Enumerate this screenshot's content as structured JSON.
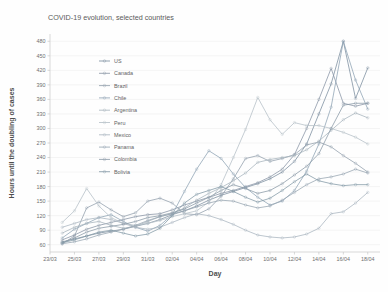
{
  "chart_data": {
    "type": "line",
    "title": "COVID-19 evolution, selected countries",
    "xlabel": "Day",
    "ylabel": "Hours until the doubling of cases",
    "grid": true,
    "legend_position": "upper-left-inside",
    "xlim": [
      0,
      27
    ],
    "ylim": [
      45,
      495
    ],
    "yticks": [
      60,
      90,
      120,
      150,
      180,
      210,
      240,
      270,
      300,
      330,
      360,
      390,
      420,
      450,
      480
    ],
    "xticks": [
      "23/03",
      "25/03",
      "27/03",
      "29/03",
      "31/03",
      "02/04",
      "04/04",
      "06/04",
      "08/04",
      "10/04",
      "12/04",
      "14/04",
      "16/04",
      "18/04"
    ],
    "xtick_positions": [
      0,
      2,
      4,
      6,
      8,
      10,
      12,
      14,
      16,
      18,
      20,
      22,
      24,
      26
    ],
    "x": [
      1,
      2,
      3,
      4,
      5,
      6,
      7,
      8,
      9,
      10,
      11,
      12,
      13,
      14,
      15,
      16,
      17,
      18,
      19,
      20,
      21,
      22,
      23,
      24,
      25,
      26
    ],
    "series": [
      {
        "name": "US",
        "color": "#7d8fa0",
        "values": [
          66,
          72,
          78,
          84,
          88,
          92,
          98,
          104,
          112,
          122,
          130,
          140,
          152,
          162,
          170,
          178,
          186,
          196,
          210,
          232,
          268,
          330,
          392,
          480,
          362,
          425
        ]
      },
      {
        "name": "Canada",
        "color": "#8a96a6",
        "values": [
          70,
          80,
          92,
          100,
          106,
          112,
          118,
          122,
          124,
          132,
          142,
          150,
          158,
          166,
          172,
          180,
          188,
          200,
          216,
          246,
          300,
          360,
          424,
          352,
          346,
          352
        ]
      },
      {
        "name": "Brazil",
        "color": "#93a0ad",
        "values": [
          62,
          78,
          136,
          148,
          132,
          118,
          126,
          150,
          156,
          146,
          124,
          122,
          134,
          160,
          196,
          238,
          244,
          232,
          238,
          246,
          266,
          272,
          262,
          244,
          228,
          210
        ]
      },
      {
        "name": "Chile",
        "color": "#8fa3b4",
        "values": [
          74,
          92,
          104,
          116,
          122,
          108,
          96,
          88,
          100,
          122,
          170,
          216,
          254,
          238,
          206,
          178,
          158,
          142,
          150,
          172,
          212,
          268,
          344,
          480,
          400,
          340
        ]
      },
      {
        "name": "Argentina",
        "color": "#a8b4bd",
        "values": [
          84,
          96,
          104,
          108,
          100,
          94,
          98,
          108,
          118,
          124,
          136,
          152,
          166,
          178,
          192,
          208,
          230,
          236,
          240,
          244,
          256,
          274,
          296,
          318,
          332,
          322
        ]
      },
      {
        "name": "Peru",
        "color": "#b6c0c8",
        "values": [
          106,
          130,
          176,
          140,
          116,
          104,
          100,
          104,
          110,
          118,
          124,
          130,
          148,
          184,
          240,
          298,
          364,
          318,
          288,
          312,
          306,
          306,
          300,
          292,
          282,
          268
        ]
      },
      {
        "name": "Mexico",
        "color": "#aab6c0",
        "values": [
          96,
          104,
          112,
          116,
          112,
          104,
          96,
          92,
          96,
          106,
          116,
          124,
          120,
          112,
          102,
          90,
          80,
          76,
          74,
          76,
          82,
          94,
          124,
          128,
          146,
          168
        ]
      },
      {
        "name": "Panama",
        "color": "#98a6b2",
        "values": [
          62,
          66,
          72,
          80,
          86,
          92,
          100,
          110,
          118,
          124,
          130,
          138,
          146,
          152,
          150,
          142,
          136,
          140,
          152,
          168,
          184,
          196,
          200,
          206,
          216,
          208
        ]
      },
      {
        "name": "Colombia",
        "color": "#8b9aa8",
        "values": [
          64,
          74,
          86,
          94,
          98,
          102,
          108,
          116,
          120,
          126,
          134,
          146,
          158,
          172,
          184,
          176,
          166,
          172,
          186,
          204,
          222,
          248,
          300,
          348,
          352,
          352
        ]
      },
      {
        "name": "Bolivia",
        "color": "#859aa8",
        "values": [
          64,
          70,
          78,
          86,
          90,
          84,
          78,
          82,
          94,
          120,
          146,
          164,
          172,
          180,
          170,
          158,
          148,
          156,
          172,
          190,
          206,
          192,
          186,
          182,
          184,
          184
        ]
      }
    ]
  },
  "legend": {
    "items": [
      "US",
      "Canada",
      "Brazil",
      "Chile",
      "Argentina",
      "Peru",
      "Mexico",
      "Panama",
      "Colombia",
      "Bolivia"
    ]
  }
}
